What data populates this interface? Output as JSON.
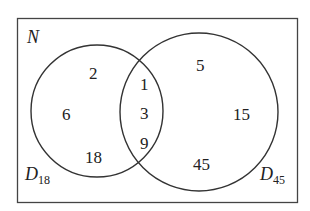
{
  "diagram": {
    "type": "venn",
    "universe": {
      "label": "N"
    },
    "sets": [
      {
        "id": "left",
        "label": "D",
        "subscript": "18"
      },
      {
        "id": "right",
        "label": "D",
        "subscript": "45"
      }
    ],
    "regions": {
      "left_only": [
        "2",
        "6",
        "18"
      ],
      "intersection": [
        "1",
        "3",
        "9"
      ],
      "right_only": [
        "5",
        "15",
        "45"
      ]
    },
    "colors": {
      "stroke": "#333333",
      "text": "#222222",
      "background": "#ffffff"
    }
  }
}
